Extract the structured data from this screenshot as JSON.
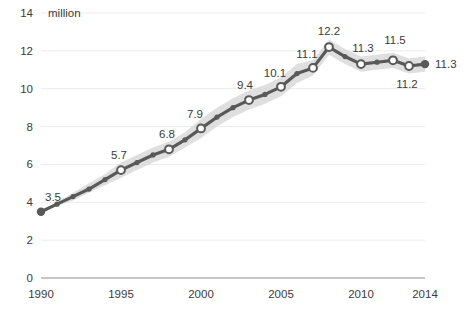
{
  "chart_data": {
    "type": "line",
    "title": "",
    "subtitle": "",
    "xlabel": "",
    "ylabel": "",
    "y_unit_label": "million",
    "xlim": [
      1990,
      2014
    ],
    "ylim": [
      0,
      14
    ],
    "grid": true,
    "legend": null,
    "y_ticks": [
      "0",
      "2",
      "4",
      "6",
      "8",
      "10",
      "12",
      "14"
    ],
    "y_tick_values": [
      0,
      2,
      4,
      6,
      8,
      10,
      12,
      14
    ],
    "x_ticks": [
      "1990",
      "1995",
      "2000",
      "2005",
      "2010",
      "2014"
    ],
    "x_tick_values": [
      1990,
      1995,
      2000,
      2005,
      2010,
      2014
    ],
    "x": [
      1990,
      1991,
      1992,
      1993,
      1994,
      1995,
      1996,
      1997,
      1998,
      1999,
      2000,
      2001,
      2002,
      2003,
      2004,
      2005,
      2006,
      2007,
      2008,
      2009,
      2010,
      2011,
      2012,
      2013,
      2014
    ],
    "series": [
      {
        "name": "Estimate",
        "values": [
          3.5,
          3.9,
          4.3,
          4.7,
          5.2,
          5.7,
          6.1,
          6.5,
          6.8,
          7.3,
          7.9,
          8.5,
          9.0,
          9.4,
          9.7,
          10.1,
          10.8,
          11.1,
          12.2,
          11.7,
          11.3,
          11.4,
          11.5,
          11.2,
          11.3
        ]
      }
    ],
    "uncertainty_band": {
      "present": true,
      "description": "light grey confidence band around the estimate line",
      "lower": [
        3.5,
        3.8,
        4.1,
        4.5,
        4.9,
        5.3,
        5.7,
        6.1,
        6.4,
        6.9,
        7.4,
        8.0,
        8.5,
        8.9,
        9.2,
        9.6,
        10.3,
        10.7,
        11.8,
        11.3,
        10.9,
        11.0,
        11.1,
        10.8,
        10.9
      ],
      "upper": [
        3.5,
        4.0,
        4.5,
        5.0,
        5.5,
        6.1,
        6.5,
        6.9,
        7.2,
        7.7,
        8.4,
        9.0,
        9.5,
        9.9,
        10.2,
        10.6,
        11.3,
        11.5,
        12.6,
        12.1,
        11.7,
        11.8,
        11.9,
        11.6,
        11.7
      ]
    },
    "labeled_points": [
      {
        "x": 1990,
        "y": 3.5,
        "label": "3.5",
        "marker": "filled",
        "label_dx": 4,
        "label_dy": -11,
        "anchor": "start"
      },
      {
        "x": 1995,
        "y": 5.7,
        "label": "5.7",
        "marker": "hollow",
        "label_dx": -2,
        "label_dy": -11,
        "anchor": "middle"
      },
      {
        "x": 1998,
        "y": 6.8,
        "label": "6.8",
        "marker": "hollow",
        "label_dx": -2,
        "label_dy": -11,
        "anchor": "middle"
      },
      {
        "x": 2000,
        "y": 7.9,
        "label": "7.9",
        "marker": "hollow",
        "label_dx": -6,
        "label_dy": -10,
        "anchor": "middle"
      },
      {
        "x": 2003,
        "y": 9.4,
        "label": "9.4",
        "marker": "hollow",
        "label_dx": -4,
        "label_dy": -11,
        "anchor": "middle"
      },
      {
        "x": 2005,
        "y": 10.1,
        "label": "10.1",
        "marker": "hollow",
        "label_dx": -6,
        "label_dy": -10,
        "anchor": "middle"
      },
      {
        "x": 2007,
        "y": 11.1,
        "label": "11.1",
        "marker": "hollow",
        "label_dx": -6,
        "label_dy": -10,
        "anchor": "middle"
      },
      {
        "x": 2008,
        "y": 12.2,
        "label": "12.2",
        "marker": "hollow",
        "label_dx": 0,
        "label_dy": -12,
        "anchor": "middle"
      },
      {
        "x": 2010,
        "y": 11.3,
        "label": "11.3",
        "marker": "hollow",
        "label_dx": 2,
        "label_dy": -12,
        "anchor": "middle"
      },
      {
        "x": 2012,
        "y": 11.5,
        "label": "11.5",
        "marker": "hollow",
        "label_dx": 2,
        "label_dy": -16,
        "anchor": "middle"
      },
      {
        "x": 2013,
        "y": 11.2,
        "label": "11.2",
        "marker": "hollow",
        "label_dx": -2,
        "label_dy": 22,
        "anchor": "middle"
      },
      {
        "x": 2014,
        "y": 11.3,
        "label": "11.3",
        "marker": "filled",
        "label_dx": 10,
        "label_dy": 4,
        "anchor": "start"
      }
    ],
    "colors": {
      "line": "#595959",
      "marker_fill": "#ffffff",
      "marker_stroke": "#595959",
      "band": "#d9d9d9",
      "grid": "#ebebeb",
      "axis": "#8c8c8c",
      "text": "#3b3b3b",
      "background": "#ffffff"
    }
  }
}
